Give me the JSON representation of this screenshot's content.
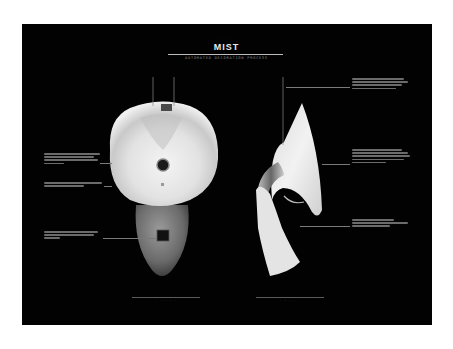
{
  "poster": {
    "pre_title": "· · · · ·",
    "title": "MIST",
    "subtitle": "AUTOMATED DECORATION PROCESS",
    "colors": {
      "background": "#020202",
      "frame": "#ffffff",
      "object": "#e6e6e6",
      "text": "#e8e8e8"
    }
  },
  "views": [
    {
      "name": "top-view",
      "caption": "· · · · ·"
    },
    {
      "name": "side-view",
      "caption": "· · · · ·"
    }
  ]
}
